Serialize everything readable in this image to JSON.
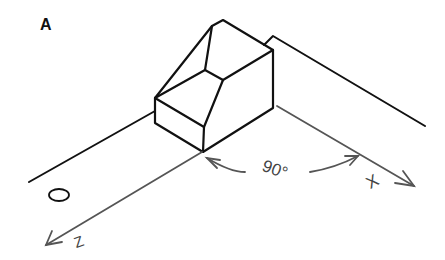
{
  "figure": {
    "panel_label": "A",
    "angle_label": "90°",
    "axis_x_label": "X",
    "axis_z_label": "Z",
    "origin_label": "O",
    "line_color": "#111111",
    "axis_color": "#555555"
  }
}
